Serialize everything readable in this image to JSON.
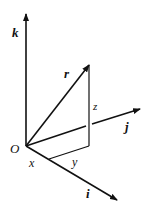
{
  "diagram": {
    "title": "",
    "type": "3D position vector in Cartesian coordinates",
    "colors": {
      "stroke": "#111111",
      "background": "#ffffff"
    },
    "labels": {
      "origin": "O",
      "k_axis": "k",
      "j_axis": "j",
      "i_axis": "i",
      "vector": "r",
      "x_component": "x",
      "y_component": "y",
      "z_component": "z"
    },
    "nodes": [
      {
        "id": "O",
        "label": "O"
      },
      {
        "id": "x_point",
        "label": "x"
      },
      {
        "id": "foot",
        "label": ""
      },
      {
        "id": "r_tip",
        "label": ""
      }
    ],
    "edges": [
      {
        "from": "O",
        "to": "k_tip",
        "label": "k",
        "arrow": true
      },
      {
        "from": "O",
        "to": "j_tip",
        "label": "j",
        "arrow": true
      },
      {
        "from": "O",
        "to": "i_tip",
        "label": "i",
        "arrow": true
      },
      {
        "from": "O",
        "to": "r_tip",
        "label": "r",
        "arrow": true
      },
      {
        "from": "x_point",
        "to": "foot",
        "label": "y",
        "arrow": false
      },
      {
        "from": "foot",
        "to": "r_tip",
        "label": "z",
        "arrow": false
      }
    ]
  }
}
